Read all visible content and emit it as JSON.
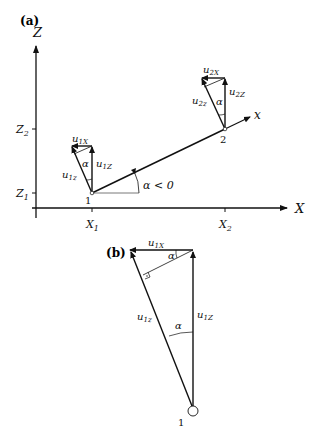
{
  "panel_a": {
    "label": "(a)",
    "axes": {
      "vertical_label": "Z",
      "horizontal_label": "X",
      "z_ticks": [
        "Z2",
        "Z1"
      ],
      "x_ticks": [
        "X1",
        "X2"
      ]
    },
    "element_axis_label": "x",
    "angle_label": "α < 0",
    "nodes": [
      "1",
      "2"
    ],
    "node1_vectors": {
      "local": "u1z",
      "global_z": "u1Z",
      "global_x": "u1X",
      "angle": "α"
    },
    "node2_vectors": {
      "local": "u2z",
      "global_z": "u2Z",
      "global_x": "u2X",
      "angle": "α"
    }
  },
  "panel_b": {
    "label": "(b)",
    "node": "1",
    "vectors": {
      "local": "u1z",
      "global_z": "u1Z",
      "global_x": "u1X"
    },
    "angle_top": "α",
    "angle_bottom": "α"
  },
  "colors": {
    "line": "#111111",
    "thin_line": "#555555",
    "background": "#ffffff"
  }
}
